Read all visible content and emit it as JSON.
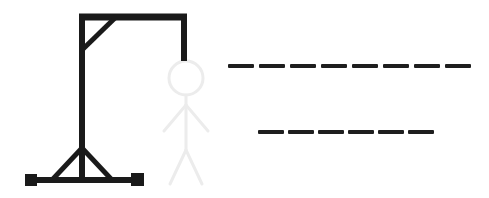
{
  "app": {
    "title": "Hangman",
    "background_color": "#ffffff",
    "width": 489,
    "height": 198
  },
  "colors": {
    "ink": "#1a1a1a",
    "figure_faded": "#ececec",
    "dash": "#1e1e1e",
    "background": "#ffffff"
  },
  "gallows": {
    "label": "Gallows",
    "stroke_color": "#1a1a1a",
    "parts": [
      {
        "name": "top-beam",
        "label": "Top beam",
        "x1": 79,
        "y1": 17,
        "x2": 187,
        "y2": 17,
        "width": 7
      },
      {
        "name": "upright-post",
        "label": "Upright post",
        "x1": 82,
        "y1": 14,
        "x2": 82,
        "y2": 182,
        "width": 6
      },
      {
        "name": "corner-brace",
        "label": "Corner diagonal brace",
        "x1": 82,
        "y1": 50,
        "x2": 116,
        "y2": 17,
        "width": 5
      },
      {
        "name": "rope",
        "label": "Rope",
        "x1": 184,
        "y1": 17,
        "x2": 184,
        "y2": 61,
        "width": 6
      },
      {
        "name": "base-bar",
        "label": "Base bar",
        "x1": 28,
        "y1": 180,
        "x2": 142,
        "y2": 180,
        "width": 6
      },
      {
        "name": "brace-left",
        "label": "Left support brace",
        "x1": 82,
        "y1": 148,
        "x2": 52,
        "y2": 180,
        "width": 5
      },
      {
        "name": "brace-right",
        "label": "Right support brace",
        "x1": 82,
        "y1": 148,
        "x2": 112,
        "y2": 180,
        "width": 5
      }
    ],
    "feet": [
      {
        "name": "foot-left",
        "label": "Left base foot",
        "x": 25,
        "y": 174,
        "size": 12
      },
      {
        "name": "foot-right",
        "label": "Right base foot",
        "x": 131,
        "y": 173,
        "size": 13
      }
    ]
  },
  "figure": {
    "label": "Hangman stick figure",
    "state": "faded",
    "stroke_color": "#ececec",
    "head": {
      "name": "head",
      "label": "Head",
      "cx": 186,
      "cy": 78,
      "r": 17,
      "width": 3
    },
    "parts": [
      {
        "name": "body",
        "label": "Body",
        "x1": 186,
        "y1": 95,
        "x2": 186,
        "y2": 150,
        "width": 3
      },
      {
        "name": "arm-left",
        "label": "Left arm",
        "x1": 186,
        "y1": 105,
        "x2": 164,
        "y2": 131,
        "width": 3
      },
      {
        "name": "arm-right",
        "label": "Right arm",
        "x1": 186,
        "y1": 105,
        "x2": 208,
        "y2": 131,
        "width": 3
      },
      {
        "name": "leg-left",
        "label": "Left leg",
        "x1": 186,
        "y1": 150,
        "x2": 170,
        "y2": 184,
        "width": 3
      },
      {
        "name": "leg-right",
        "label": "Right leg",
        "x1": 186,
        "y1": 150,
        "x2": 202,
        "y2": 184,
        "width": 3
      }
    ]
  },
  "puzzle": {
    "label": "Hidden phrase",
    "dash_color": "#1e1e1e",
    "dash_height": 4,
    "lines": [
      {
        "name": "puzzle-line-1",
        "label": "First word row",
        "letter_count": 8,
        "letters": [
          "",
          "",
          "",
          "",
          "",
          "",
          "",
          ""
        ],
        "y": 64,
        "start_x": 228,
        "dash_width": 26,
        "gap": 5
      },
      {
        "name": "puzzle-line-2",
        "label": "Second word row",
        "letter_count": 6,
        "letters": [
          "",
          "",
          "",
          "",
          "",
          ""
        ],
        "y": 130,
        "start_x": 258,
        "dash_width": 26,
        "gap": 4
      }
    ]
  }
}
